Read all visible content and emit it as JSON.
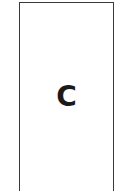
{
  "panel": {
    "label": "C",
    "border_color": "#3a3a3a",
    "text_color": "#1a1a1a"
  }
}
